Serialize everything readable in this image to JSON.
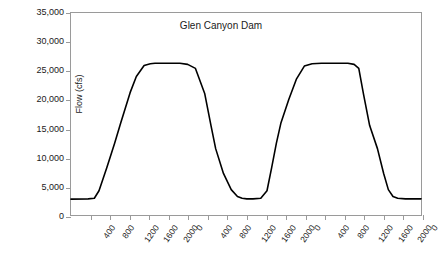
{
  "chart_data": {
    "type": "line",
    "title": "Glen Canyon Dam",
    "xlabel": "",
    "ylabel": "Flow (cfs)",
    "ylim": [
      0,
      35000
    ],
    "ytick_values": [
      0,
      5000,
      10000,
      15000,
      20000,
      25000,
      30000,
      35000
    ],
    "ytick_labels": [
      "0",
      "5,000",
      "10,000",
      "15,000",
      "20,000",
      "25,000",
      "30,000",
      "35,000"
    ],
    "xtick_labels": [
      "400",
      "800",
      "1200",
      "1600",
      "2000",
      "0",
      "400",
      "800",
      "1200",
      "1600",
      "2000",
      "0",
      "400",
      "800",
      "1200",
      "1600",
      "2000",
      "0"
    ],
    "x_axis_description": "Time of day (hour, 24-hour clock) over three consecutive days",
    "grid": false,
    "legend": null,
    "series": [
      {
        "name": "Glen Canyon Dam release",
        "low_plateau_value": 2800,
        "high_plateau_value": 26200,
        "cycles": 3,
        "x": [
          0.0,
          2.2,
          3.0,
          3.6,
          4.6,
          5.6,
          6.4,
          7.0,
          7.6,
          8.4,
          9.4,
          10.2,
          10.8,
          11.4,
          12.0,
          13.0,
          14.0,
          15.0,
          16.0,
          17.2,
          18.0,
          18.6,
          19.6,
          20.6,
          21.4,
          22.0,
          22.6,
          23.4,
          24.4,
          25.2,
          25.8,
          26.4,
          27.0,
          28.0,
          29.0,
          30.0,
          31.0,
          32.2,
          33.0,
          33.6,
          34.6,
          35.6,
          36.4,
          37.0,
          37.6,
          38.4,
          39.4,
          40.2,
          40.8,
          41.4,
          42.0,
          43.0,
          44.0,
          45.0
        ],
        "y": [
          2750,
          2800,
          2900,
          4200,
          8200,
          12400,
          16000,
          18600,
          21200,
          24000,
          25900,
          26200,
          26300,
          26300,
          26300,
          26300,
          26300,
          26100,
          25400,
          21000,
          15500,
          11500,
          7200,
          4400,
          3200,
          2900,
          2800,
          2800,
          2900,
          4200,
          8200,
          12400,
          16000,
          20000,
          23600,
          25800,
          26200,
          26300,
          26300,
          26300,
          26300,
          26300,
          26100,
          25400,
          21000,
          15500,
          11500,
          7200,
          4400,
          3200,
          2900,
          2800,
          2800,
          2800
        ]
      }
    ]
  },
  "axes": {
    "y_label": "Flow (cfs)",
    "title": "Glen Canyon Dam"
  }
}
